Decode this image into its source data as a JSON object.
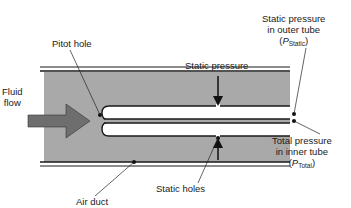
{
  "diagram": {
    "labels": {
      "pitot_hole": "Pitot hole",
      "fluid_flow_line1": "Fluid",
      "fluid_flow_line2": "flow",
      "static_pressure": "Static pressure",
      "static_outer_line1": "Static pressure",
      "static_outer_line2": "in outer tube",
      "static_outer_symbol": "P",
      "static_outer_subscript": "Static",
      "total_inner_line1": "Total pressure",
      "total_inner_line2": "in inner tube",
      "total_inner_symbol": "P",
      "total_inner_subscript": "Total",
      "static_holes": "Static holes",
      "air_duct": "Air duct"
    },
    "colors": {
      "duct_fill": "#a9a9a9",
      "arrow_fill": "#6e6e6e",
      "line": "#1a1a1a",
      "background": "#ffffff"
    }
  }
}
